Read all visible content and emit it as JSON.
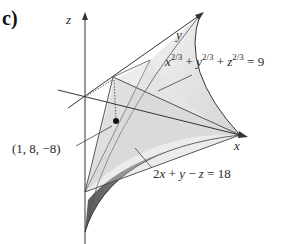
{
  "figure": {
    "part_label": "c)",
    "axes": {
      "x": "x",
      "y": "y",
      "z": "z"
    },
    "surface_equation": {
      "lhs_terms": [
        {
          "var": "x",
          "exp": "2/3"
        },
        {
          "var": "y",
          "exp": "2/3"
        },
        {
          "var": "z",
          "exp": "2/3"
        }
      ],
      "plus": "+",
      "equals": "=",
      "rhs": "9"
    },
    "plane_equation": {
      "text_parts": [
        "2",
        "x",
        " + ",
        "y",
        " − ",
        "z",
        " = 18"
      ]
    },
    "point_label": "(1, 8, −8)",
    "colors": {
      "line": "#2a2a2a",
      "surface_light": "#e6e6e6",
      "surface_mid": "#cfcfcf",
      "surface_dark": "#6e6e6e"
    }
  }
}
